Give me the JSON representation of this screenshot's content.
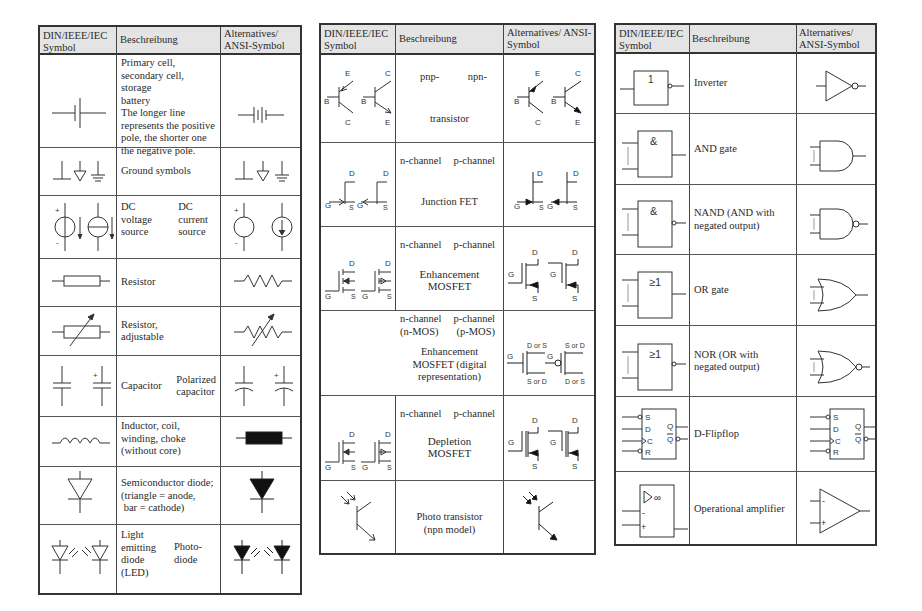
{
  "headers": {
    "symbol": "DIN/IEEE/IEC Symbol",
    "description": "Beschreibung",
    "alternative": "Alternatives/ ANSI-Symbol"
  },
  "table1": {
    "rows": [
      {
        "name": "battery",
        "description": [
          "Primary cell,",
          "secondary cell, storage",
          "battery",
          "The longer line",
          "represents the positive",
          "pole, the shorter one",
          "the negative pole."
        ]
      },
      {
        "name": "ground",
        "description": [
          "Ground symbols"
        ]
      },
      {
        "name": "dc-sources",
        "description_left": [
          "DC",
          "voltage",
          "source"
        ],
        "description_right": [
          "DC",
          "current",
          "source"
        ]
      },
      {
        "name": "resistor",
        "description": [
          "Resistor"
        ]
      },
      {
        "name": "resistor-adjustable",
        "description": [
          "Resistor,",
          "adjustable"
        ]
      },
      {
        "name": "capacitor",
        "description_left": [
          "Capacitor"
        ],
        "description_right": [
          "Polarized",
          "capacitor"
        ]
      },
      {
        "name": "inductor",
        "description": [
          "Inductor, coil,",
          "winding, choke",
          "(without core)"
        ]
      },
      {
        "name": "diode",
        "description": [
          "Semiconductor diode;",
          "(triangle = anode,",
          " bar = cathode)"
        ]
      },
      {
        "name": "led-photodiode",
        "description_left": [
          "Light",
          "emitting",
          "diode",
          "(LED)"
        ],
        "description_right": [
          "Photo-",
          "diode"
        ]
      }
    ]
  },
  "table2": {
    "rows": [
      {
        "name": "bjt",
        "description_top_left": "pnp-",
        "description_top_right": "npn-",
        "description_bottom": "transistor"
      },
      {
        "name": "jfet",
        "description_top_left": "n-channel",
        "description_top_right": "p-channel",
        "description_bottom": "Junction FET"
      },
      {
        "name": "mosfet-enh",
        "description_top_left": "n-channel",
        "description_top_right": "p-channel",
        "description_bottom": [
          "Enhancement",
          "MOSFET"
        ]
      },
      {
        "name": "mosfet-digital",
        "description_top_left": "n-channel (n-MOS)",
        "description_top_right": "p-channel (p-MOS)",
        "description_bottom": [
          "Enhancement",
          "MOSFET (digital",
          "representation)"
        ]
      },
      {
        "name": "mosfet-depl",
        "description_top_left": "n-channel",
        "description_top_right": "p-channel",
        "description_bottom": [
          "Depletion",
          "MOSFET"
        ]
      },
      {
        "name": "phototransistor",
        "description": [
          "Photo transistor",
          "(npn model)"
        ]
      }
    ],
    "labels": {
      "B": "B",
      "C": "C",
      "E": "E",
      "D": "D",
      "G": "G",
      "S": "S",
      "DorS": "D or S",
      "SorD": "S or D"
    }
  },
  "table3": {
    "rows": [
      {
        "name": "inverter",
        "din_label": "1",
        "description": [
          "Inverter"
        ]
      },
      {
        "name": "and",
        "din_label": "&",
        "description": [
          "AND gate"
        ]
      },
      {
        "name": "nand",
        "din_label": "&",
        "description": [
          "NAND (AND with",
          "negated output)"
        ]
      },
      {
        "name": "or",
        "din_label": "≥1",
        "description": [
          "OR gate"
        ]
      },
      {
        "name": "nor",
        "din_label": "≥1",
        "description": [
          "NOR (OR with",
          "negated output)"
        ]
      },
      {
        "name": "dff",
        "pins": [
          "S",
          "D",
          "C",
          "R",
          "Q",
          "Q̄"
        ],
        "description": [
          "D-Flipflop"
        ]
      },
      {
        "name": "opamp",
        "din_label": "▷ ∞",
        "pins": [
          "-",
          "+"
        ],
        "description": [
          "Operational amplifier"
        ]
      }
    ]
  }
}
